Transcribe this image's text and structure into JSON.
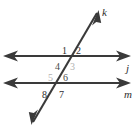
{
  "figure": {
    "type": "geometry-diagram",
    "background_color": "#ffffff",
    "stroke_color": "#3a3a3a",
    "label_color_dark": "#2e2e2e",
    "label_color_light": "#a8a8a8"
  },
  "lines": [
    {
      "id": "line-j",
      "name": "j",
      "orientation": "horizontal",
      "arrowheads": "both",
      "y": 56,
      "x1": 4,
      "x2": 130,
      "label_x": 128,
      "label_y": 70
    },
    {
      "id": "line-m",
      "name": "m",
      "orientation": "horizontal",
      "arrowheads": "both",
      "y": 83,
      "x1": 4,
      "x2": 130,
      "label_x": 127,
      "label_y": 97
    },
    {
      "id": "line-k",
      "name": "k",
      "orientation": "transversal",
      "arrowheads": "both",
      "x1": 33,
      "y1": 122,
      "x2": 97,
      "y2": 13,
      "label_x": 102,
      "label_y": 13
    }
  ],
  "angles": [
    {
      "id": "angle-1",
      "label": "1",
      "x": 62,
      "y": 52,
      "shade": "dark"
    },
    {
      "id": "angle-2",
      "label": "2",
      "x": 76,
      "y": 52,
      "shade": "dark"
    },
    {
      "id": "angle-4",
      "label": "4",
      "x": 55,
      "y": 68,
      "shade": "dark"
    },
    {
      "id": "angle-3",
      "label": "3",
      "x": 70,
      "y": 68,
      "shade": "light"
    },
    {
      "id": "angle-5",
      "label": "5",
      "x": 49,
      "y": 79,
      "shade": "light"
    },
    {
      "id": "angle-6",
      "label": "6",
      "x": 64,
      "y": 79,
      "shade": "dark"
    },
    {
      "id": "angle-8",
      "label": "8",
      "x": 43,
      "y": 96,
      "shade": "dark"
    },
    {
      "id": "angle-7",
      "label": "7",
      "x": 60,
      "y": 96,
      "shade": "dark"
    }
  ]
}
